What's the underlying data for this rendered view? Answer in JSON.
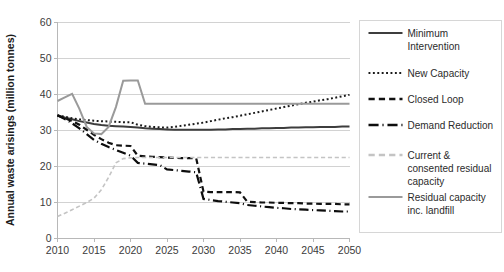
{
  "chart_data": {
    "type": "line",
    "title": "",
    "xlabel": "",
    "ylabel": "Annual waste arisings (million tonnes)",
    "xlim": [
      2010,
      2050
    ],
    "ylim": [
      0,
      60
    ],
    "grid": true,
    "legend_position": "right",
    "x_ticks": [
      "2010",
      "2015",
      "2020",
      "2025",
      "2030",
      "2035",
      "2040",
      "2045",
      "2050"
    ],
    "y_ticks": [
      "0",
      "10",
      "20",
      "30",
      "40",
      "50",
      "60"
    ],
    "x": [
      2010,
      2011,
      2012,
      2013,
      2014,
      2015,
      2016,
      2017,
      2018,
      2019,
      2020,
      2021,
      2022,
      2023,
      2024,
      2025,
      2026,
      2027,
      2028,
      2029,
      2030,
      2031,
      2032,
      2033,
      2034,
      2035,
      2036,
      2037,
      2038,
      2039,
      2040,
      2041,
      2042,
      2043,
      2044,
      2045,
      2046,
      2047,
      2048,
      2049,
      2050
    ],
    "series": [
      {
        "name": "Minimum Intervention",
        "style": "solid",
        "color": "#3d3d3d",
        "width": 2.0,
        "values": [
          34.2,
          33.6,
          33.1,
          32.6,
          32.2,
          31.8,
          31.5,
          31.3,
          31.2,
          31.1,
          31.0,
          30.8,
          30.6,
          30.5,
          30.4,
          30.3,
          30.2,
          30.2,
          30.2,
          30.2,
          30.2,
          30.2,
          30.3,
          30.3,
          30.4,
          30.4,
          30.5,
          30.5,
          30.6,
          30.6,
          30.7,
          30.7,
          30.8,
          30.8,
          30.9,
          30.9,
          31.0,
          31.0,
          31.0,
          31.1,
          31.1
        ]
      },
      {
        "name": "New Capacity",
        "style": "dotted",
        "color": "#1a1a1a",
        "width": 2.0,
        "values": [
          34.2,
          33.8,
          33.4,
          33.1,
          32.9,
          32.7,
          32.6,
          32.5,
          32.4,
          32.3,
          32.3,
          31.6,
          31.2,
          31.0,
          30.9,
          30.8,
          31.0,
          31.3,
          31.6,
          31.9,
          32.2,
          32.6,
          33.0,
          33.4,
          33.7,
          34.1,
          34.5,
          34.9,
          35.3,
          35.7,
          36.1,
          36.5,
          36.9,
          37.3,
          37.7,
          38.0,
          38.4,
          38.7,
          39.1,
          39.5,
          39.9
        ]
      },
      {
        "name": "Closed Loop",
        "style": "dashed",
        "color": "#111111",
        "width": 2.2,
        "values": [
          34.2,
          33.4,
          32.6,
          31.6,
          30.2,
          28.8,
          27.6,
          26.6,
          25.9,
          25.8,
          25.7,
          23.0,
          22.8,
          22.7,
          22.6,
          22.5,
          22.4,
          22.3,
          22.3,
          22.3,
          13.0,
          12.9,
          12.9,
          12.9,
          12.9,
          12.8,
          10.2,
          10.1,
          10.0,
          10.0,
          9.9,
          9.9,
          9.8,
          9.8,
          9.7,
          9.7,
          9.6,
          9.6,
          9.6,
          9.5,
          9.5
        ]
      },
      {
        "name": "Demand Reduction",
        "style": "dashdot",
        "color": "#0d0d0d",
        "width": 2.2,
        "values": [
          34.2,
          33.2,
          32.0,
          30.6,
          29.0,
          27.4,
          26.3,
          25.4,
          24.6,
          23.8,
          23.0,
          21.0,
          20.8,
          20.6,
          20.4,
          19.2,
          19.0,
          18.8,
          18.6,
          18.4,
          11.0,
          10.7,
          10.4,
          10.2,
          10.0,
          9.8,
          9.3,
          9.1,
          8.9,
          8.7,
          8.5,
          8.4,
          8.2,
          8.1,
          8.0,
          7.9,
          7.8,
          7.7,
          7.6,
          7.5,
          7.5
        ]
      },
      {
        "name": "Current & consented residual capacity",
        "style": "dashed",
        "color": "#c4c4c4",
        "width": 1.6,
        "values": [
          6.1,
          7.0,
          8.0,
          9.0,
          10.0,
          11.2,
          13.5,
          17.0,
          21.0,
          22.2,
          22.4,
          22.5,
          22.5,
          22.5,
          22.5,
          22.5,
          22.5,
          22.5,
          22.5,
          22.5,
          22.5,
          22.5,
          22.5,
          22.5,
          22.5,
          22.5,
          22.5,
          22.5,
          22.5,
          22.5,
          22.5,
          22.5,
          22.5,
          22.5,
          22.5,
          22.5,
          22.5,
          22.5,
          22.5,
          22.5,
          22.5
        ]
      },
      {
        "name": "Residual capacity inc. landfill",
        "style": "solid",
        "color": "#9a9a9a",
        "width": 2.0,
        "values": [
          38.2,
          39.2,
          40.2,
          36.0,
          31.0,
          29.2,
          29.0,
          31.0,
          36.5,
          43.8,
          43.9,
          43.9,
          37.4,
          37.4,
          37.4,
          37.4,
          37.4,
          37.4,
          37.4,
          37.4,
          37.4,
          37.4,
          37.4,
          37.4,
          37.4,
          37.4,
          37.4,
          37.4,
          37.4,
          37.4,
          37.4,
          37.4,
          37.4,
          37.4,
          37.4,
          37.4,
          37.4,
          37.4,
          37.4,
          37.4,
          37.4
        ]
      }
    ],
    "legend_entries": [
      {
        "label_line1": "Minimum",
        "label_line2": "Intervention",
        "label_line3": "",
        "style": "solid",
        "color": "#3d3d3d"
      },
      {
        "label_line1": "New Capacity",
        "label_line2": "",
        "label_line3": "",
        "style": "dotted",
        "color": "#1a1a1a"
      },
      {
        "label_line1": "Closed Loop",
        "label_line2": "",
        "label_line3": "",
        "style": "dashed",
        "color": "#111111"
      },
      {
        "label_line1": "Demand Reduction",
        "label_line2": "",
        "label_line3": "",
        "style": "dashdot",
        "color": "#0d0d0d"
      },
      {
        "label_line1": "Current &",
        "label_line2": "consented residual",
        "label_line3": "capacity",
        "style": "dashed",
        "color": "#c4c4c4"
      },
      {
        "label_line1": "Residual capacity",
        "label_line2": "inc. landfill",
        "label_line3": "",
        "style": "solid",
        "color": "#9a9a9a"
      }
    ]
  }
}
